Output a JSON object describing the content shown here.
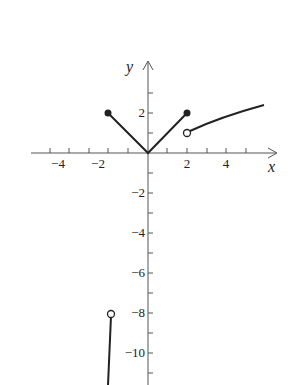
{
  "axes": {
    "x_label": "x",
    "y_label": "y"
  },
  "x_ticks": [
    {
      "v": -4,
      "label": "−4"
    },
    {
      "v": -2,
      "label": "−2"
    },
    {
      "v": 2,
      "label": "2"
    },
    {
      "v": 4,
      "label": "4"
    }
  ],
  "y_ticks": [
    {
      "v": 2,
      "label": "2"
    },
    {
      "v": -2,
      "label": "−2"
    },
    {
      "v": -4,
      "label": "−4"
    },
    {
      "v": -6,
      "label": "−6"
    },
    {
      "v": -8,
      "label": "−8"
    },
    {
      "v": -10,
      "label": "−10"
    }
  ],
  "pieces": [
    {
      "name": "abs-left",
      "from": [
        -2,
        2
      ],
      "to": [
        0,
        0
      ],
      "left_end": "closed"
    },
    {
      "name": "abs-right",
      "from": [
        0,
        0
      ],
      "to": [
        2,
        2
      ],
      "right_end": "closed"
    },
    {
      "name": "right-curve",
      "from": [
        2,
        1
      ],
      "to": [
        5.9,
        2.2
      ],
      "left_end": "open"
    },
    {
      "name": "left-cubic",
      "from": [
        -2,
        -8
      ],
      "to": [
        -2.2,
        -11.5
      ],
      "right_end": "open"
    }
  ],
  "colors": {
    "line": "#222222",
    "axis": "#555555"
  }
}
